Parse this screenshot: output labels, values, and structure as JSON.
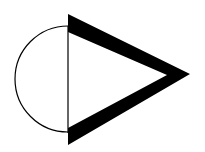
{
  "diagram": {
    "shapes": [
      {
        "kind": "semicircle",
        "side": "left",
        "stroke": "#000000",
        "fill": "none"
      },
      {
        "kind": "vertical-line",
        "stroke": "#000000"
      },
      {
        "kind": "triangle",
        "direction": "right",
        "outline": "thick",
        "stroke": "#000000",
        "fill": "#ffffff"
      }
    ],
    "colors": {
      "ink": "#000000",
      "background": "#ffffff"
    }
  }
}
